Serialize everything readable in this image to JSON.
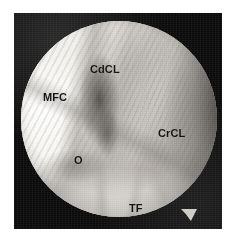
{
  "figure": {
    "name": "arthroscopic-stifle-joint-view",
    "modality": "arthroscopy",
    "field_shape": "circle",
    "background_color": "#0a0a0a",
    "page_background_color": "#ffffff",
    "label_color": "#131313"
  },
  "labels": [
    {
      "id": "cdcl",
      "text": "CdCL",
      "name": "label-caudal-cruciate-ligament"
    },
    {
      "id": "mfc",
      "text": "MFC",
      "name": "label-medial-femoral-condyle"
    },
    {
      "id": "crcl",
      "text": "CrCL",
      "name": "label-cranial-cruciate-ligament"
    },
    {
      "id": "o",
      "text": "O",
      "name": "label-o"
    },
    {
      "id": "tf",
      "text": "TF",
      "name": "label-tibial-surface"
    }
  ]
}
